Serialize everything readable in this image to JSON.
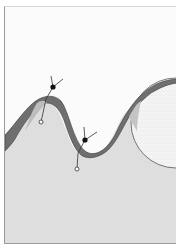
{
  "figure": {
    "colors": {
      "background": "#fbfbfb",
      "lower_region": "#dedede",
      "wave_band": "#707070",
      "wave_band_light": "#bdbdbd",
      "sphere": "#f3f3f3",
      "line": "#333333",
      "marker_solid": "#111111",
      "marker_open": "#ffffff"
    },
    "markers": [
      {
        "name": "crest-marker",
        "type": "solid-dot",
        "x": 52,
        "y": 86
      },
      {
        "name": "crest-anchor",
        "type": "open-circle",
        "x": 40,
        "y": 121
      },
      {
        "name": "trough-marker",
        "type": "solid-dot",
        "x": 84,
        "y": 139
      },
      {
        "name": "trough-anchor",
        "type": "open-circle",
        "x": 76,
        "y": 168
      }
    ],
    "sphere": {
      "cx": 175,
      "cy": 122,
      "r": 45
    }
  }
}
